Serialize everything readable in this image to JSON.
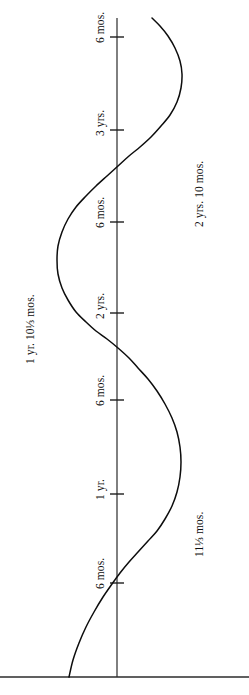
{
  "figure": {
    "background_color": "#ffffff",
    "ink_color": "#0d0d0d",
    "width": 249,
    "height": 695
  },
  "axis": {
    "name": "vertical-time-axis",
    "x": 117,
    "top_y": 18,
    "bottom_y": 677,
    "baseline_y": 677,
    "baseline_x_start": 0,
    "baseline_x_end": 249
  },
  "ticks": [
    {
      "label": "6 mos.",
      "y": 583
    },
    {
      "label": "1 yr.",
      "y": 494
    },
    {
      "label": "6 mos.",
      "y": 400
    },
    {
      "label": "2 yrs.",
      "y": 313
    },
    {
      "label": "6 mos.",
      "y": 222
    },
    {
      "label": "3 yrs.",
      "y": 130
    },
    {
      "label": "6 mos.",
      "y": 37
    }
  ],
  "annotations": [
    {
      "label": "11⅓ mos.",
      "x": 205,
      "y": 545
    },
    {
      "label": "1 yr. 10⅓ mos.",
      "x": 36,
      "y": 352
    },
    {
      "label": "2 yrs. 10 mos.",
      "x": 205,
      "y": 215
    }
  ],
  "chart_data": {
    "type": "line",
    "title": "",
    "xlabel": "",
    "ylabel": "",
    "orientation": "vertical-time-axis",
    "grid": false,
    "legend": null,
    "axis_ticks": [
      "6 mos.",
      "1 yr.",
      "6 mos.",
      "2 yrs.",
      "6 mos.",
      "3 yrs.",
      "6 mos."
    ],
    "axis_tick_months": [
      6,
      12,
      18,
      24,
      30,
      36,
      42
    ],
    "annotated_extrema": [
      {
        "label": "11⅓ mos.",
        "months": 11.33,
        "type": "maximum-right"
      },
      {
        "label": "1 yr. 10⅓ mos.",
        "months": 22.33,
        "type": "maximum-left"
      },
      {
        "label": "2 yrs. 10 mos.",
        "months": 34,
        "type": "maximum-right"
      }
    ],
    "curve_points": [
      [
        69,
        677
      ],
      [
        73,
        660
      ],
      [
        79,
        643
      ],
      [
        86,
        627
      ],
      [
        94,
        612
      ],
      [
        103,
        597
      ],
      [
        112,
        584
      ],
      [
        120,
        573
      ],
      [
        129,
        562
      ],
      [
        138,
        552
      ],
      [
        148,
        541
      ],
      [
        157,
        531
      ],
      [
        165,
        519
      ],
      [
        172,
        506
      ],
      [
        177,
        492
      ],
      [
        180,
        477
      ],
      [
        181,
        462
      ],
      [
        180,
        447
      ],
      [
        177,
        432
      ],
      [
        172,
        418
      ],
      [
        165,
        404
      ],
      [
        157,
        391
      ],
      [
        148,
        379
      ],
      [
        138,
        368
      ],
      [
        129,
        358
      ],
      [
        118,
        348
      ],
      [
        107,
        339
      ],
      [
        96,
        331
      ],
      [
        86,
        322
      ],
      [
        76,
        312
      ],
      [
        68,
        300
      ],
      [
        62,
        288
      ],
      [
        58,
        274
      ],
      [
        57,
        260
      ],
      [
        58,
        246
      ],
      [
        62,
        232
      ],
      [
        68,
        219
      ],
      [
        76,
        207
      ],
      [
        86,
        196
      ],
      [
        96,
        186
      ],
      [
        107,
        176
      ],
      [
        118,
        166
      ],
      [
        129,
        156
      ],
      [
        140,
        147
      ],
      [
        151,
        137
      ],
      [
        161,
        126
      ],
      [
        170,
        115
      ],
      [
        177,
        102
      ],
      [
        181,
        88
      ],
      [
        182,
        74
      ],
      [
        180,
        61
      ],
      [
        175,
        48
      ],
      [
        168,
        36
      ],
      [
        160,
        26
      ],
      [
        152,
        18
      ]
    ]
  }
}
